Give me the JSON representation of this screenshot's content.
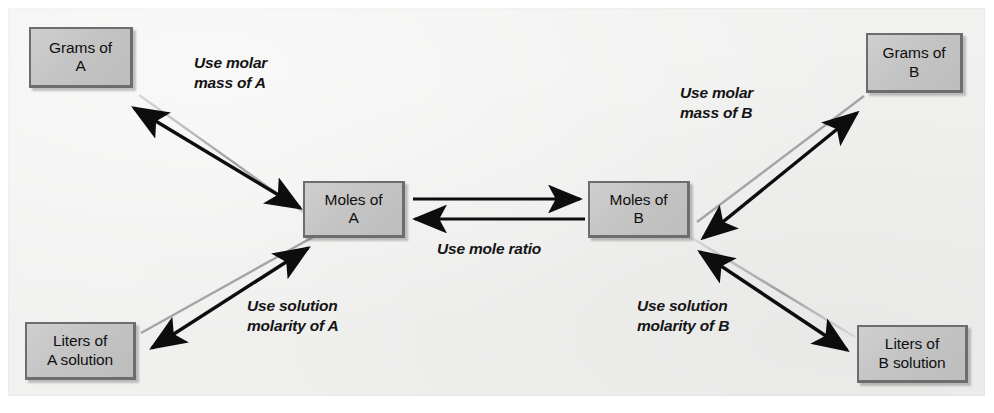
{
  "figure": {
    "panel_background": "#f1f1f0",
    "box_fill": "#c6c6c6",
    "box_border": "#6d6d6d",
    "arrow_color": "#0d0d0d",
    "arrow_shadow_color": "#b6b6b6"
  },
  "nodes": [
    {
      "id": "grams-a",
      "label": "Grams of\nA"
    },
    {
      "id": "grams-b",
      "label": "Grams of\nB"
    },
    {
      "id": "moles-a",
      "label": "Moles of\nA"
    },
    {
      "id": "moles-b",
      "label": "Moles of\nB"
    },
    {
      "id": "liters-a",
      "label": "Liters of\nA solution"
    },
    {
      "id": "liters-b",
      "label": "Liters of\nB solution"
    }
  ],
  "edges": [
    {
      "id": "molar-mass-a",
      "label": "Use molar\nmass of A",
      "from": "grams-a",
      "to": "moles-a",
      "arrows": "both"
    },
    {
      "id": "molar-mass-b",
      "label": "Use molar\nmass of B",
      "from": "moles-b",
      "to": "grams-b",
      "arrows": "both"
    },
    {
      "id": "mole-ratio",
      "label": "Use mole ratio",
      "from": "moles-a",
      "to": "moles-b",
      "arrows": "both"
    },
    {
      "id": "solution-molarity-a",
      "label": "Use solution\nmolarity of A",
      "from": "liters-a",
      "to": "moles-a",
      "arrows": "both"
    },
    {
      "id": "solution-molarity-b",
      "label": "Use solution\nmolarity of B",
      "from": "moles-b",
      "to": "liters-b",
      "arrows": "both"
    }
  ]
}
